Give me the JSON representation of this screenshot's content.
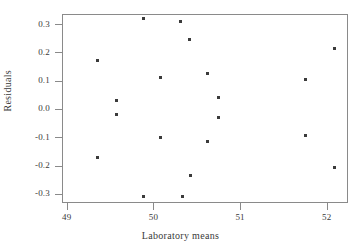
{
  "chart_data": {
    "type": "scatter",
    "title": "",
    "xlabel": "Laboratory means",
    "ylabel": "Residuals",
    "xlim": [
      48.78,
      52.08
    ],
    "ylim": [
      -0.335,
      0.335
    ],
    "xticks": [
      49,
      50,
      51,
      52
    ],
    "xtick_labels": [
      "49",
      "50",
      "51",
      "52"
    ],
    "yticks": [
      0.3,
      0.2,
      0.1,
      0.0,
      -0.1,
      -0.2,
      -0.3
    ],
    "ytick_labels": [
      "0.3",
      "0.2",
      "0.1",
      "0.0",
      "-0.1",
      "-0.2",
      "-0.3"
    ],
    "grid": false,
    "legend": null,
    "marker": "square",
    "marker_color": "#3b3b3b",
    "marker_size_px": 3,
    "frame_color": "#8a8a8a",
    "background": "#ffffff",
    "points": [
      {
        "x": 49.36,
        "y": 0.17
      },
      {
        "x": 49.36,
        "y": -0.17
      },
      {
        "x": 49.57,
        "y": 0.03
      },
      {
        "x": 49.58,
        "y": -0.02
      },
      {
        "x": 49.88,
        "y": 0.32
      },
      {
        "x": 49.89,
        "y": -0.31
      },
      {
        "x": 50.08,
        "y": 0.11
      },
      {
        "x": 50.08,
        "y": -0.1
      },
      {
        "x": 50.31,
        "y": 0.31
      },
      {
        "x": 50.33,
        "y": -0.31
      },
      {
        "x": 50.42,
        "y": 0.245
      },
      {
        "x": 50.43,
        "y": -0.235
      },
      {
        "x": 50.62,
        "y": 0.125
      },
      {
        "x": 50.62,
        "y": -0.115
      },
      {
        "x": 50.75,
        "y": 0.04
      },
      {
        "x": 50.75,
        "y": -0.03
      },
      {
        "x": 51.75,
        "y": 0.105
      },
      {
        "x": 51.76,
        "y": -0.095
      },
      {
        "x": 52.09,
        "y": 0.215
      },
      {
        "x": 52.09,
        "y": -0.205
      }
    ]
  }
}
